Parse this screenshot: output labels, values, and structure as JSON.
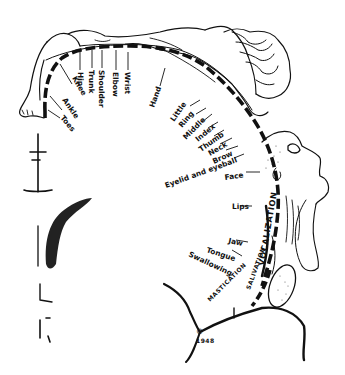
{
  "figure": {
    "background": "#ffffff",
    "ink_color": "#111111"
  },
  "labels": {
    "toes": "Toes",
    "ankle": "Ankle",
    "knee": "Knee",
    "hip": "Hip",
    "trunk": "Trunk",
    "shoulder": "Shoulder",
    "elbow": "Elbow",
    "wrist": "Wrist",
    "hand": "Hand",
    "little": "Little",
    "ring": "Ring",
    "middle": "Middle",
    "index": "Index",
    "thumb": "Thumb",
    "neck": "Neck",
    "brow": "Brow",
    "eyelid": "Eyelid and eyeball",
    "face": "Face",
    "lips": "Lips",
    "jaw": "Jaw",
    "tongue": "Tongue",
    "swallowing": "Swallowing",
    "mastication": "MASTICATION",
    "salivation": "SALIVATION",
    "vocalization": "VOCALIZATION",
    "copyright": "©",
    "year": "1948"
  }
}
